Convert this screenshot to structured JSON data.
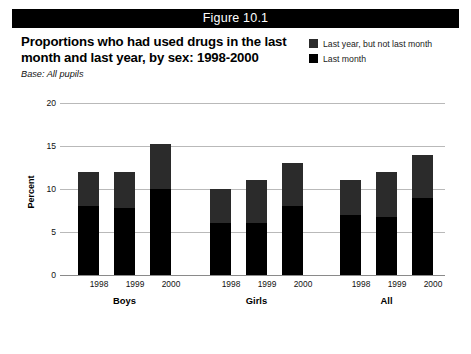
{
  "figure": {
    "header": "Figure 10.1",
    "title": "Proportions who had used drugs in the last month and last year, by sex: 1998-2000",
    "base_note": "Base: All pupils"
  },
  "colors": {
    "header_bg": "#000000",
    "header_text": "#ffffff",
    "last_year_not_month": "#2b2b2b",
    "last_month": "#000000",
    "gridline": "#b9b9b9",
    "axis": "#8a8a8a",
    "page_bg": "#ffffff"
  },
  "legend": {
    "position": "top-right",
    "items": [
      {
        "label": "Last year, but not last month",
        "color": "#2b2b2b",
        "swatch_name": "legend-swatch-last-year"
      },
      {
        "label": "Last month",
        "color": "#000000",
        "swatch_name": "legend-swatch-last-month"
      }
    ]
  },
  "chart_data": {
    "type": "bar",
    "subtype": "stacked",
    "title": "Proportions who had used drugs in the last month and last year, by sex: 1998-2000",
    "subtitle": "Base: All pupils",
    "xlabel": "",
    "ylabel": "Percent",
    "ylim": [
      0,
      20
    ],
    "yticks": [
      0,
      5,
      10,
      15,
      20
    ],
    "ytick_labels": [
      "0",
      "5",
      "10",
      "15",
      "20"
    ],
    "grid": true,
    "legend_position": "top-right",
    "groups": [
      "Boys",
      "Girls",
      "All"
    ],
    "categories": [
      "1998",
      "1999",
      "2000",
      "1998",
      "1999",
      "2000",
      "1998",
      "1999",
      "2000"
    ],
    "series": [
      {
        "name": "Last month",
        "color": "#000000",
        "values": [
          8.0,
          7.8,
          10.0,
          6.0,
          6.0,
          8.0,
          7.0,
          6.8,
          9.0
        ]
      },
      {
        "name": "Last year, but not last month",
        "color": "#2b2b2b",
        "values": [
          4.0,
          4.2,
          5.2,
          4.0,
          5.0,
          5.0,
          4.0,
          5.2,
          5.0
        ]
      }
    ],
    "totals": [
      12.0,
      12.0,
      15.2,
      10.0,
      11.0,
      13.0,
      11.0,
      12.0,
      14.0
    ],
    "bars": [
      {
        "group": "Boys",
        "year": "1998",
        "last_month": 8.0,
        "last_year_not_month": 4.0,
        "total": 12.0
      },
      {
        "group": "Boys",
        "year": "1999",
        "last_month": 7.8,
        "last_year_not_month": 4.2,
        "total": 12.0
      },
      {
        "group": "Boys",
        "year": "2000",
        "last_month": 10.0,
        "last_year_not_month": 5.2,
        "total": 15.2
      },
      {
        "group": "Girls",
        "year": "1998",
        "last_month": 6.0,
        "last_year_not_month": 4.0,
        "total": 10.0
      },
      {
        "group": "Girls",
        "year": "1999",
        "last_month": 6.0,
        "last_year_not_month": 5.0,
        "total": 11.0
      },
      {
        "group": "Girls",
        "year": "2000",
        "last_month": 8.0,
        "last_year_not_month": 5.0,
        "total": 13.0
      },
      {
        "group": "All",
        "year": "1998",
        "last_month": 7.0,
        "last_year_not_month": 4.0,
        "total": 11.0
      },
      {
        "group": "All",
        "year": "1999",
        "last_month": 6.8,
        "last_year_not_month": 5.2,
        "total": 12.0
      },
      {
        "group": "All",
        "year": "2000",
        "last_month": 9.0,
        "last_year_not_month": 5.0,
        "total": 14.0
      }
    ]
  }
}
